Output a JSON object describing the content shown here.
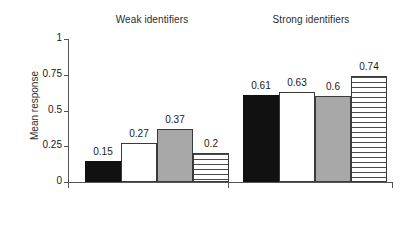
{
  "chart_data": {
    "type": "bar",
    "title": "",
    "xlabel": "",
    "ylabel": "Mean response",
    "ylim": [
      0,
      1
    ],
    "yticks": [
      "0",
      "0.25",
      "0.5",
      "0.75",
      "1"
    ],
    "ytick_values": [
      0,
      0.25,
      0.5,
      0.75,
      1
    ],
    "grid": false,
    "legend": "none",
    "groups": [
      {
        "label": "Weak identifiers",
        "bars": [
          {
            "value": 0.15,
            "value_label": "0.15",
            "fill": "black",
            "fill_color": "#111111"
          },
          {
            "value": 0.27,
            "value_label": "0.27",
            "fill": "white",
            "fill_color": "#ffffff"
          },
          {
            "value": 0.37,
            "value_label": "0.37",
            "fill": "gray",
            "fill_color": "#a8a8a8"
          },
          {
            "value": 0.2,
            "value_label": "0.2",
            "fill": "stripe",
            "fill_color": "#ffffff"
          }
        ]
      },
      {
        "label": "Strong identifiers",
        "bars": [
          {
            "value": 0.61,
            "value_label": "0.61",
            "fill": "black",
            "fill_color": "#111111"
          },
          {
            "value": 0.63,
            "value_label": "0.63",
            "fill": "white",
            "fill_color": "#ffffff"
          },
          {
            "value": 0.6,
            "value_label": "0.6",
            "fill": "gray",
            "fill_color": "#a8a8a8"
          },
          {
            "value": 0.74,
            "value_label": "0.74",
            "fill": "stripe",
            "fill_color": "#ffffff"
          }
        ]
      }
    ],
    "categories": [
      "Weak identifiers",
      "Strong identifiers"
    ],
    "series": [
      {
        "name": "black",
        "values": [
          0.15,
          0.61
        ]
      },
      {
        "name": "white",
        "values": [
          0.27,
          0.63
        ]
      },
      {
        "name": "gray",
        "values": [
          0.37,
          0.6
        ]
      },
      {
        "name": "stripe",
        "values": [
          0.2,
          0.74
        ]
      }
    ]
  },
  "axes": {
    "y_label": "Mean response",
    "y_ticks": [
      "1",
      "0.75",
      "0.5",
      "0.25",
      "0"
    ]
  },
  "colors": {
    "axis": "#555555",
    "text": "#1a1a1a",
    "bar_outline": "#3a3a3a",
    "bar_black": "#111111",
    "bar_white": "#ffffff",
    "bar_gray": "#a8a8a8",
    "stripe_line": "#4a4a4a",
    "background": "#ffffff"
  }
}
